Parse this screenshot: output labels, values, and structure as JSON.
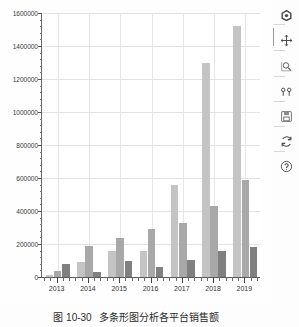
{
  "figure": {
    "background_color": "#fdfdfd",
    "axes_background_color": "#ffffff",
    "grid_color": "#e3e3e3"
  },
  "caption": {
    "number": "图 10-30",
    "text": "多条形图分析各平台销售额"
  },
  "toolbar": {
    "items": [
      {
        "name": "home-icon",
        "label": "Home",
        "icon": "home"
      },
      {
        "name": "move-icon",
        "label": "Pan/Move",
        "icon": "move"
      },
      {
        "name": "zoom-rect-icon",
        "label": "Zoom to rectangle",
        "icon": "zoom-rect"
      },
      {
        "name": "configure-subplots-icon",
        "label": "Configure subplots",
        "icon": "subplots"
      },
      {
        "name": "save-figure-icon",
        "label": "Save the figure",
        "icon": "save"
      },
      {
        "name": "refresh-icon",
        "label": "Refresh",
        "icon": "refresh"
      },
      {
        "name": "help-icon",
        "label": "Help",
        "icon": "help"
      }
    ]
  },
  "chart_data": {
    "type": "bar",
    "title": "",
    "xlabel": "",
    "ylabel": "",
    "grid": true,
    "legend": "none",
    "categories": [
      "2013",
      "2014",
      "2015",
      "2016",
      "2017",
      "2018",
      "2019"
    ],
    "ylim": [
      0,
      1600000
    ],
    "yticks": [
      0,
      200000,
      400000,
      600000,
      800000,
      1000000,
      1200000,
      1400000,
      1600000
    ],
    "ytick_labels": [
      "0",
      "200000",
      "400000",
      "600000",
      "800000",
      "1000000",
      "1200000",
      "1400000",
      "1600000"
    ],
    "series": [
      {
        "name": "series-1",
        "color": "#c4c4c4",
        "values": [
          10000,
          90000,
          160000,
          155000,
          560000,
          1300000,
          1520000
        ]
      },
      {
        "name": "series-2",
        "color": "#a8a8a8",
        "values": [
          35000,
          190000,
          235000,
          290000,
          325000,
          430000,
          585000
        ]
      },
      {
        "name": "series-3",
        "color": "#808080",
        "values": [
          80000,
          30000,
          95000,
          60000,
          105000,
          155000,
          180000
        ]
      }
    ]
  }
}
